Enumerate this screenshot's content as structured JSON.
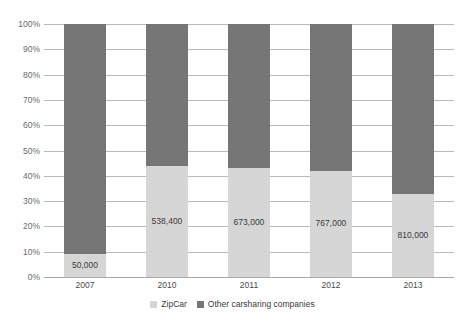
{
  "chart_data": {
    "type": "bar",
    "stacked": true,
    "normalized": true,
    "title": "",
    "subtitle": "",
    "xlabel": "",
    "ylabel": "",
    "categories": [
      "2007",
      "2010",
      "2011",
      "2012",
      "2013"
    ],
    "ylim": [
      0,
      100
    ],
    "ytick_labels": [
      "0%",
      "10%",
      "20%",
      "30%",
      "40%",
      "50%",
      "60%",
      "70%",
      "80%",
      "90%",
      "100%"
    ],
    "ytick_values": [
      0,
      10,
      20,
      30,
      40,
      50,
      60,
      70,
      80,
      90,
      100
    ],
    "grid": true,
    "legend_position": "bottom",
    "series": [
      {
        "name": "ZipCar",
        "color": "#d6d6d6",
        "values": [
          9,
          44,
          43,
          42,
          33
        ],
        "data_labels": [
          "50,000",
          "538,400",
          "673,000",
          "767,000",
          "810,000"
        ]
      },
      {
        "name": "Other carsharing companies",
        "color": "#767676",
        "values": [
          91,
          56,
          57,
          58,
          67
        ],
        "data_labels": [
          "",
          "",
          "",
          "",
          ""
        ]
      }
    ]
  },
  "legend": {
    "items": [
      {
        "label": "ZipCar",
        "color": "#d6d6d6"
      },
      {
        "label": "Other carsharing companies",
        "color": "#767676"
      }
    ]
  }
}
